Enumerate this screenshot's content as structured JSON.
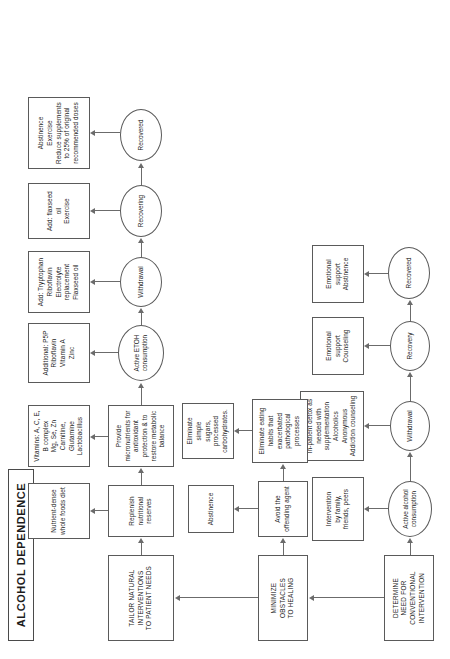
{
  "document": {
    "title": "ALCOHOL DEPENDENCE",
    "type": "clinical-flowchart",
    "orientation": "rotated-90-ccw"
  },
  "stages": {
    "determine": "DETERMINE\nNEED FOR\nCONVENTIONAL\nINTERVENTION",
    "minimize": "MINIMIZE\nOBSTACLES\nTO HEALING",
    "tailor": "TAILOR NATURAL\nINTERVENTIONS\nTO PATIENT NEEDS"
  },
  "conventional_track": {
    "states": [
      {
        "id": "active-alcohol",
        "label": "Active alcohol\nconsumption"
      },
      {
        "id": "withdrawal",
        "label": "Withdrawal"
      },
      {
        "id": "recovery",
        "label": "Recovery"
      },
      {
        "id": "recovered",
        "label": "Recovered"
      }
    ],
    "interventions": [
      {
        "id": "intervention-family",
        "label": "Intervention\nby family,\nfriends, peers"
      },
      {
        "id": "inpatient-detox",
        "label": "In-patient detox as\nneeded with\nsupplementation\nAlcoholics Anonymous\nAddiction counseling"
      },
      {
        "id": "emotional-support-counseling",
        "label": "Emotional\nsupport\nCounseling"
      },
      {
        "id": "emotional-support-abstinence",
        "label": "Emotional\nsupport\nAbstinence"
      }
    ]
  },
  "obstacles_track": {
    "steps": [
      {
        "id": "avoid-offending-agent",
        "label": "Avoid the\noffending agent"
      },
      {
        "id": "eliminate-eating-habits",
        "label": "Eliminate eating\nhabits that\nexacerbated\npathological\nprocesses"
      }
    ],
    "outputs": [
      {
        "id": "abstinence",
        "label": "Abstinence"
      },
      {
        "id": "eliminate-simple-sugars",
        "label": "Eliminate simple\nsugars, processed\ncarbohydrates."
      }
    ]
  },
  "natural_track": {
    "steps": [
      {
        "id": "replenish-reserves",
        "label": "Replenish\nnutritional\nreserves"
      },
      {
        "id": "provide-micronutrients",
        "label": "Provide\nmicronutrients for\nantioxidant\nprotection & to\nrestore metabolic\nbalance"
      }
    ],
    "outputs": [
      {
        "id": "nutrient-dense-diet",
        "label": "Nutrient-dense\nwhole foods diet"
      },
      {
        "id": "vitamins-list",
        "label": "Vitamins: A, C, E,\nB complex\nMg, Se, Zn\nCarnitine, Glutamine\nLactobacillus"
      }
    ],
    "states": [
      {
        "id": "active-etoh",
        "label": "Active ETOH\nconsumption"
      },
      {
        "id": "withdrawal",
        "label": "Withdrawal"
      },
      {
        "id": "recovering",
        "label": "Recovering"
      },
      {
        "id": "recovered",
        "label": "Recovered"
      }
    ],
    "protocols": [
      {
        "id": "protocol-active-etoh",
        "label": "Additional: P5P\nRiboflavin\nVitamin A\nZinc"
      },
      {
        "id": "protocol-withdrawal",
        "label": "Add: Tryptophan\nRiboflavin\nElectrolyte replacement\nFlaxseed oil"
      },
      {
        "id": "protocol-recovering",
        "label": "Add: flaxseed oil\nExercise"
      },
      {
        "id": "protocol-recovered",
        "label": "Abstinence\nExercise\nReduce supplements\nto 25% of original\nrecommended doses"
      }
    ]
  },
  "colors": {
    "stroke": "#5a5a5a",
    "edge": "#6b6b6b",
    "background": "#ffffff",
    "text": "#1c1c1c"
  }
}
